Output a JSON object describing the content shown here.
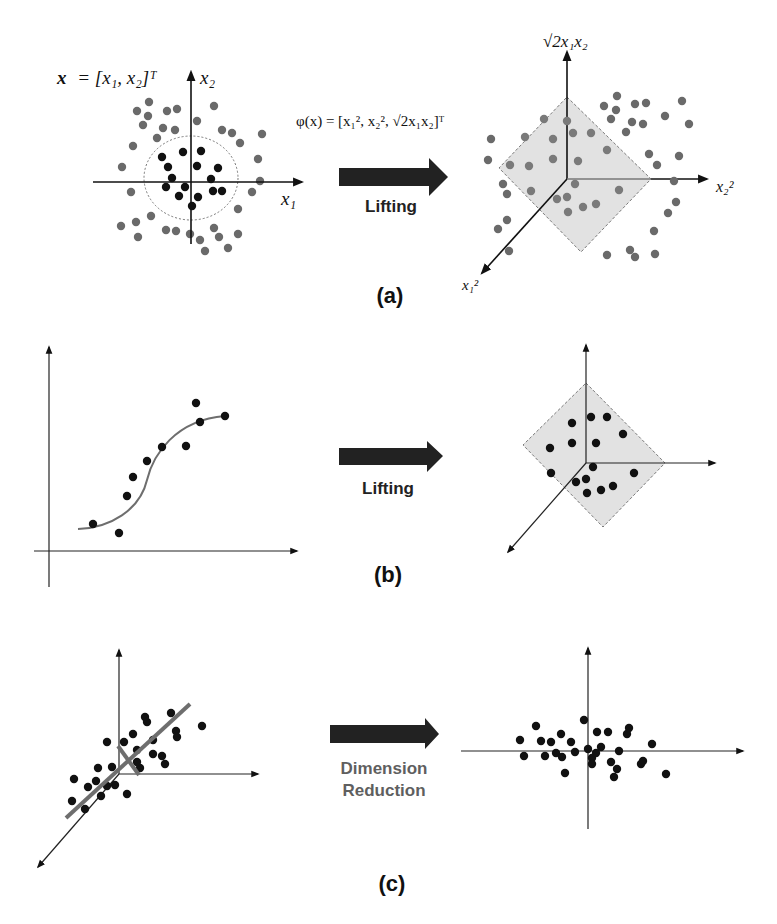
{
  "figure": {
    "panels": [
      {
        "id": "a",
        "label": "(a)",
        "operation": "Lifting",
        "left": {
          "input_label_lhs": "x",
          "input_label_rhs": "= [x₁, x₂]ᵀ",
          "x_axis_label": "x₁",
          "y_axis_label": "x₂",
          "origin": [
            191,
            182
          ],
          "x_axis": [
            93,
            302
          ],
          "y_axis": [
            72,
            244
          ],
          "boundary_circle": {
            "cx": 191,
            "cy": 178,
            "rx": 47,
            "ry": 42
          },
          "inner_points": [
            [
              183,
              152
            ],
            [
              201,
              151
            ],
            [
              162,
              157
            ],
            [
              168,
              167
            ],
            [
              197,
              166
            ],
            [
              218,
              168
            ],
            [
              172,
              178
            ],
            [
              211,
              179
            ],
            [
              166,
              187
            ],
            [
              185,
              187
            ],
            [
              213,
              191
            ],
            [
              222,
              191
            ],
            [
              179,
              196
            ],
            [
              198,
              197
            ],
            [
              192,
              206
            ]
          ],
          "outer_points": [
            [
              149,
              102
            ],
            [
              137,
              111
            ],
            [
              148,
              116
            ],
            [
              167,
              111
            ],
            [
              177,
              109
            ],
            [
              214,
              106
            ],
            [
              143,
              125
            ],
            [
              197,
              121
            ],
            [
              163,
              128
            ],
            [
              175,
              130
            ],
            [
              222,
              130
            ],
            [
              232,
              133
            ],
            [
              262,
              134
            ],
            [
              157,
              138
            ],
            [
              240,
              143
            ],
            [
              133,
              146
            ],
            [
              258,
              159
            ],
            [
              122,
              167
            ],
            [
              260,
              181
            ],
            [
              131,
              192
            ],
            [
              252,
              192
            ],
            [
              238,
              209
            ],
            [
              151,
              216
            ],
            [
              136,
              222
            ],
            [
              121,
              226
            ],
            [
              166,
              230
            ],
            [
              176,
              231
            ],
            [
              190,
              234
            ],
            [
              214,
              228
            ],
            [
              138,
              237
            ],
            [
              200,
              240
            ],
            [
              219,
              237
            ],
            [
              238,
              234
            ],
            [
              228,
              248
            ],
            [
              205,
              251
            ]
          ]
        },
        "mapping": "φ(x) = [x₁², x₂², √2x₁x₂]ᵀ",
        "right": {
          "z_axis_label": "√2x₁x₂",
          "x_axis_label": "x₂²",
          "y_axis_label": "x₁²",
          "origin": [
            567,
            179
          ],
          "plane": [
            [
              567,
              97
            ],
            [
              651,
              179
            ],
            [
              581,
              252
            ],
            [
              499,
              168
            ]
          ],
          "axis_top": [
            567,
            52
          ],
          "axis_right": [
            707,
            179
          ],
          "axis_down_left": [
            482,
            273
          ],
          "plane_points": [
            [
              544,
              119
            ],
            [
              525,
              137
            ],
            [
              567,
              121
            ],
            [
              573,
              133
            ],
            [
              591,
              133
            ],
            [
              553,
              139
            ],
            [
              607,
              150
            ],
            [
              510,
              165
            ],
            [
              529,
              166
            ],
            [
              553,
              159
            ],
            [
              578,
              161
            ],
            [
              575,
              184
            ],
            [
              619,
              190
            ],
            [
              531,
              191
            ],
            [
              557,
              199
            ],
            [
              567,
              197
            ],
            [
              568,
              212
            ],
            [
              583,
              207
            ],
            [
              596,
              204
            ]
          ],
          "outer_points": [
            [
              617,
              96
            ],
            [
              604,
              106
            ],
            [
              616,
              110
            ],
            [
              635,
              104
            ],
            [
              646,
              103
            ],
            [
              682,
              101
            ],
            [
              611,
              119
            ],
            [
              632,
              122
            ],
            [
              643,
              124
            ],
            [
              665,
              116
            ],
            [
              689,
              124
            ],
            [
              626,
              132
            ],
            [
              649,
              154
            ],
            [
              657,
              165
            ],
            [
              679,
              156
            ],
            [
              674,
              181
            ],
            [
              676,
              202
            ],
            [
              668,
              213
            ],
            [
              654,
              231
            ],
            [
              607,
              255
            ],
            [
              630,
              250
            ],
            [
              635,
              257
            ],
            [
              655,
              254
            ],
            [
              491,
              139
            ],
            [
              488,
              160
            ],
            [
              503,
              184
            ],
            [
              507,
              194
            ],
            [
              507,
              220
            ],
            [
              498,
              229
            ],
            [
              509,
              251
            ]
          ]
        }
      },
      {
        "id": "b",
        "label": "(b)",
        "operation": "Lifting",
        "left": {
          "origin": [
            49,
            551
          ],
          "x_axis": [
            34,
            297
          ],
          "y_axis": [
            347,
            587
          ],
          "curve": "M78,529 C110,528 140,510 147,480 C153,455 175,420 225,416",
          "points": [
            [
              93,
              524
            ],
            [
              119,
              533
            ],
            [
              127,
              496
            ],
            [
              133,
              477
            ],
            [
              147,
              461
            ],
            [
              162,
              447
            ],
            [
              186,
              446
            ],
            [
              196,
              403
            ],
            [
              200,
              422
            ],
            [
              225,
              416
            ]
          ]
        },
        "right": {
          "origin": [
            586,
            463
          ],
          "plane": [
            [
              586,
              383
            ],
            [
              665,
              463
            ],
            [
              603,
              527
            ],
            [
              523,
              445
            ]
          ],
          "axis_top": [
            586,
            345
          ],
          "axis_right": [
            715,
            463
          ],
          "axis_down_left": [
            508,
            552
          ],
          "points": [
            [
              572,
              423
            ],
            [
              591,
              417
            ],
            [
              607,
              417
            ],
            [
              623,
              434
            ],
            [
              550,
              448
            ],
            [
              572,
              443
            ],
            [
              596,
              443
            ],
            [
              593,
              467
            ],
            [
              551,
              473
            ],
            [
              634,
              473
            ],
            [
              576,
              482
            ],
            [
              586,
              479
            ],
            [
              613,
              486
            ],
            [
              601,
              490
            ],
            [
              587,
              493
            ]
          ]
        }
      },
      {
        "id": "c",
        "label": "(c)",
        "operation_line1": "Dimension",
        "operation_line2": "Reduction",
        "left": {
          "origin": [
            119,
            774
          ],
          "axis_top": [
            119,
            650
          ],
          "axis_right": [
            258,
            774
          ],
          "axis_down_left": [
            38,
            867
          ],
          "principal_line": [
            [
              66,
              818
            ],
            [
              190,
              704
            ]
          ],
          "perpendicular_line": [
            [
              118,
              746
            ],
            [
              139,
              775
            ]
          ],
          "points": [
            [
              74,
              779
            ],
            [
              72,
              801
            ],
            [
              88,
              787
            ],
            [
              96,
              781
            ],
            [
              98,
              768
            ],
            [
              85,
              809
            ],
            [
              101,
              796
            ],
            [
              107,
              742
            ],
            [
              112,
              767
            ],
            [
              115,
              785
            ],
            [
              107,
              786
            ],
            [
              124,
              742
            ],
            [
              127,
              794
            ],
            [
              133,
              734
            ],
            [
              137,
              750
            ],
            [
              145,
              717
            ],
            [
              147,
              722
            ],
            [
              153,
              754
            ],
            [
              162,
              756
            ],
            [
              165,
              764
            ],
            [
              171,
              713
            ],
            [
              176,
              731
            ],
            [
              177,
              737
            ],
            [
              202,
              726
            ],
            [
              140,
              768
            ],
            [
              137,
              762
            ],
            [
              153,
              740
            ]
          ]
        },
        "right": {
          "origin": [
            588,
            751
          ],
          "x_axis": [
            461,
            743
          ],
          "y_axis": [
            648,
            829
          ],
          "points": [
            [
              520,
              740
            ],
            [
              524,
              756
            ],
            [
              536,
              726
            ],
            [
              541,
              741
            ],
            [
              545,
              756
            ],
            [
              551,
              742
            ],
            [
              556,
              753
            ],
            [
              561,
              734
            ],
            [
              562,
              757
            ],
            [
              565,
              773
            ],
            [
              571,
              742
            ],
            [
              575,
              752
            ],
            [
              584,
              720
            ],
            [
              588,
              749
            ],
            [
              592,
              758
            ],
            [
              592,
              764
            ],
            [
              597,
              732
            ],
            [
              596,
              753
            ],
            [
              601,
              747
            ],
            [
              608,
              732
            ],
            [
              611,
              762
            ],
            [
              617,
              769
            ],
            [
              614,
              777
            ],
            [
              619,
              751
            ],
            [
              627,
              734
            ],
            [
              629,
              728
            ],
            [
              641,
              764
            ],
            [
              643,
              761
            ],
            [
              652,
              744
            ],
            [
              666,
              774
            ]
          ]
        }
      }
    ],
    "colors": {
      "axis": "#111111",
      "inner_point": "#111111",
      "outer_point": "#6a6a6a",
      "plane_point": "#7a7a7a",
      "plane_fill": "#e2e2e2",
      "plane_stroke": "#7a7a7a",
      "curve": "#6e6e6e",
      "principal_line": "#6e6e6e",
      "arrow": "#222222",
      "reduction_text": "#5f5f5f",
      "circle": "#777777"
    }
  }
}
